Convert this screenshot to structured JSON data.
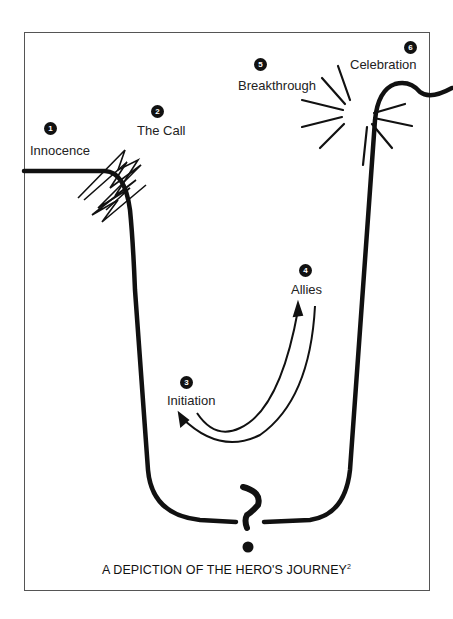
{
  "title": "A DEPICTION OF THE HERO'S JOURNEY",
  "footnote": "2",
  "stages": [
    {
      "number": "1",
      "label": "Innocence"
    },
    {
      "number": "2",
      "label": "The Call"
    },
    {
      "number": "3",
      "label": "Initiation"
    },
    {
      "number": "4",
      "label": "Allies"
    },
    {
      "number": "5",
      "label": "Breakthrough"
    },
    {
      "number": "6",
      "label": "Celebration"
    }
  ],
  "center_symbol": "?",
  "colors": {
    "line": "#111111",
    "frame": "#555555",
    "background": "#ffffff"
  }
}
